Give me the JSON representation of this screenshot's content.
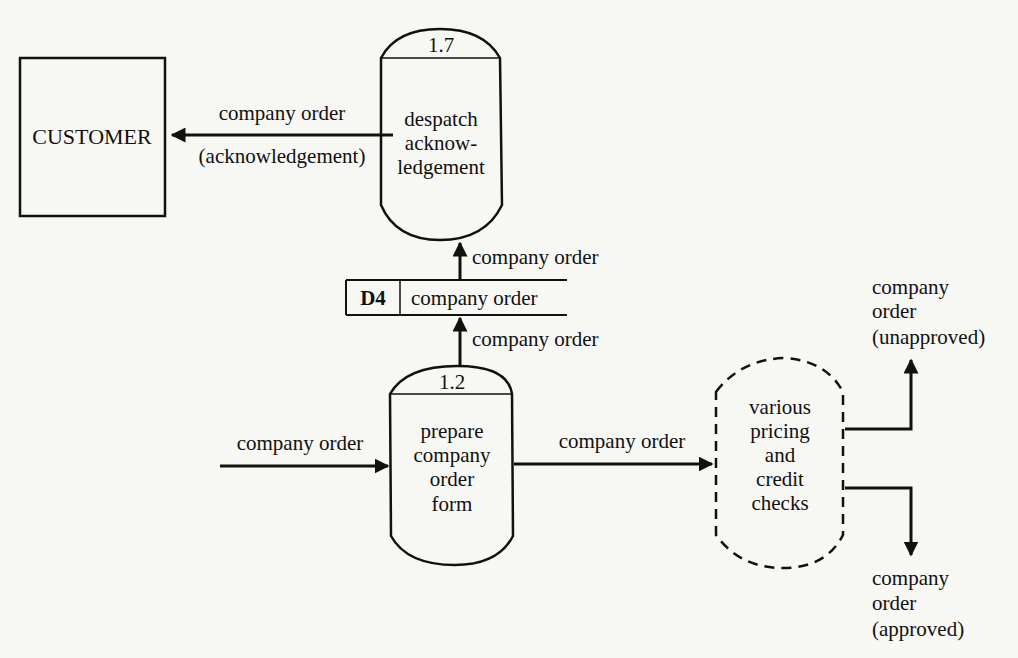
{
  "diagram": {
    "type": "data-flow-diagram",
    "external_entity": {
      "label": "CUSTOMER"
    },
    "processes": [
      {
        "id": "1.7",
        "lines": [
          "despatch",
          "acknow-",
          "ledgement"
        ]
      },
      {
        "id": "1.2",
        "lines": [
          "prepare",
          "company",
          "order",
          "form"
        ]
      },
      {
        "id": "",
        "style": "dashed",
        "lines": [
          "various",
          "pricing",
          "and",
          "credit",
          "checks"
        ]
      }
    ],
    "data_store": {
      "id": "D4",
      "label": "company order"
    },
    "flows": {
      "to_customer": {
        "line1": "company order",
        "line2": "(acknowledgement)"
      },
      "store_to_17": "company order",
      "12_to_store": "company order",
      "input_to_12": "company order",
      "12_to_checks": "company order",
      "unapproved": [
        "company",
        "order",
        "(unapproved)"
      ],
      "approved": [
        "company",
        "order",
        "(approved)"
      ]
    }
  }
}
